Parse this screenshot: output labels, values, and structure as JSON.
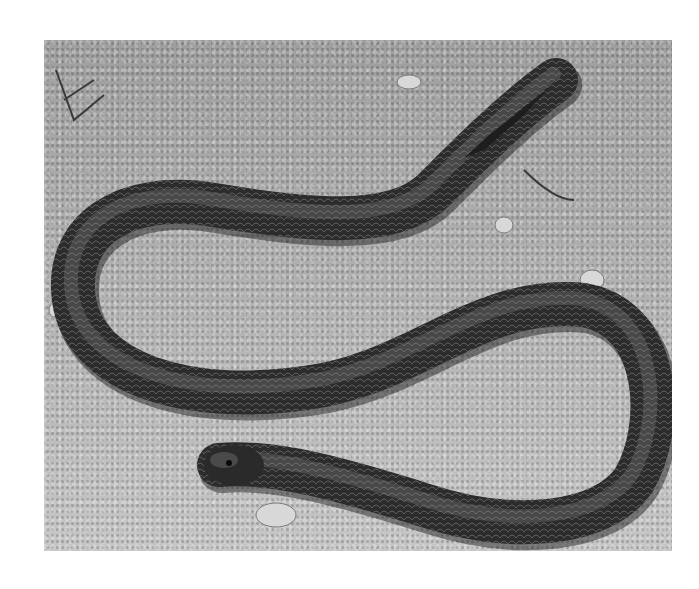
{
  "image": {
    "subject": "snake-on-soil",
    "description": "Black-and-white photograph of a dark, glossy-scaled snake lying in an S-shaped curve on a sandy, pebbly soil surface, head at lower left facing left, tail tapering at upper right",
    "colors": {
      "page_background": "#ffffff",
      "soil": "#a9a9a9",
      "snake_body": "#2a2a2a",
      "snake_highlight": "#8a8a8a"
    },
    "photo_bounds": {
      "left": 44,
      "top": 40,
      "width": 628,
      "height": 511
    }
  }
}
